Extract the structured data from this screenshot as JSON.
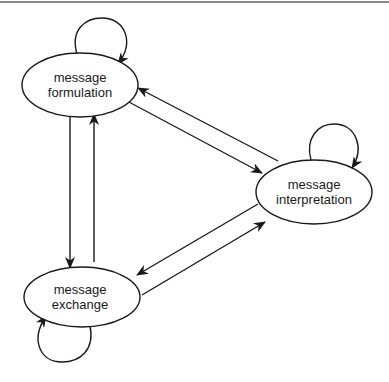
{
  "diagram": {
    "type": "state-transition",
    "nodes": [
      {
        "id": "formulation",
        "line1": "message",
        "line2": "formulation"
      },
      {
        "id": "interpretation",
        "line1": "message",
        "line2": "interpretation"
      },
      {
        "id": "exchange",
        "line1": "message",
        "line2": "exchange"
      }
    ],
    "edges": [
      {
        "from": "formulation",
        "to": "formulation",
        "kind": "self-loop"
      },
      {
        "from": "interpretation",
        "to": "interpretation",
        "kind": "self-loop"
      },
      {
        "from": "exchange",
        "to": "exchange",
        "kind": "self-loop"
      },
      {
        "from": "formulation",
        "to": "exchange"
      },
      {
        "from": "exchange",
        "to": "formulation"
      },
      {
        "from": "formulation",
        "to": "interpretation"
      },
      {
        "from": "interpretation",
        "to": "formulation"
      },
      {
        "from": "interpretation",
        "to": "exchange"
      },
      {
        "from": "exchange",
        "to": "interpretation"
      }
    ],
    "colors": {
      "stroke": "#1a1a1a",
      "background": "#ffffff",
      "border": "#8a8a8a"
    }
  }
}
